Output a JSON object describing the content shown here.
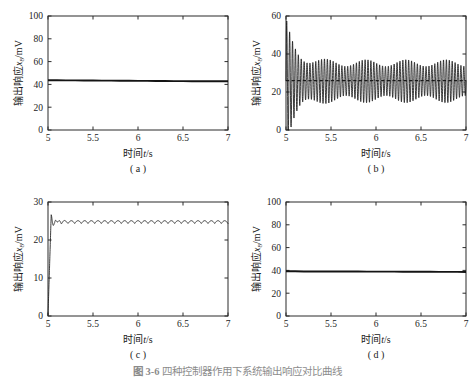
{
  "figure": {
    "caption_number": "图 3-6",
    "caption_text": "四种控制器作用下系统输出响应对比曲线",
    "background_color": "#ffffff",
    "line_color": "#1a1a1a"
  },
  "chart_data": [
    {
      "type": "line",
      "panel_tag": "( a )",
      "title": "",
      "xlabel": "时间t/s",
      "ylabel": "输出响应x8/mV",
      "xlabel_plain": "时间t/s",
      "ylabel_plain": "输出响应x8/mV",
      "xlim": [
        5,
        7
      ],
      "ylim": [
        0,
        100
      ],
      "xticks": [
        5,
        5.5,
        6,
        6.5,
        7
      ],
      "xticklabels": [
        "5",
        "5.5",
        "6",
        "6.5",
        "7"
      ],
      "yticks": [
        0,
        20,
        40,
        60,
        80,
        100
      ],
      "yticklabels": [
        "0",
        "20",
        "40",
        "60",
        "80",
        "100"
      ],
      "grid": false,
      "legend": "none",
      "series": [
        {
          "name": "x8",
          "style": "thick-solid",
          "x": [
            5,
            5.1,
            5.2,
            5.3,
            5.4,
            5.5,
            5.6,
            5.7,
            5.8,
            5.9,
            6,
            6.1,
            6.2,
            6.3,
            6.4,
            6.5,
            6.6,
            6.7,
            6.8,
            6.9,
            7
          ],
          "values": [
            43.6,
            43.6,
            43.5,
            43.5,
            43.4,
            43.4,
            43.3,
            43.3,
            43.2,
            43.2,
            43.1,
            43.1,
            43.0,
            43.0,
            42.9,
            42.9,
            42.8,
            42.8,
            42.8,
            42.7,
            42.7
          ]
        }
      ]
    },
    {
      "type": "line",
      "panel_tag": "( b )",
      "title": "",
      "xlabel": "时间t/s",
      "ylabel": "输出响应x8/mV",
      "xlabel_plain": "时间t/s",
      "ylabel_plain": "输出响应x8/mV",
      "xlim": [
        5,
        7
      ],
      "ylim": [
        0,
        60
      ],
      "xticks": [
        5,
        5.5,
        6,
        6.5,
        7
      ],
      "xticklabels": [
        "5",
        "5.5",
        "6",
        "6.5",
        "7"
      ],
      "yticks": [
        0,
        20,
        40,
        60
      ],
      "yticklabels": [
        "0",
        "20",
        "40",
        "60"
      ],
      "grid": false,
      "legend": "none",
      "oscillation": {
        "description": "damped high-frequency oscillation with beat modulation about a mean of 26 mV",
        "mean": 26,
        "initial_peak": 59,
        "initial_trough": 11,
        "steady_high": 37,
        "steady_low": 20,
        "cycles": 62,
        "decay_rate": 9.0,
        "beat_cycles": 4.5,
        "beat_depth": 0.32
      },
      "reference_line": {
        "name": "setpoint",
        "style": "dashed",
        "value": 26
      }
    },
    {
      "type": "line",
      "panel_tag": "( c )",
      "title": "",
      "xlabel": "时间t/s",
      "ylabel": "输出响应x8/mV",
      "xlabel_plain": "时间t/s",
      "ylabel_plain": "输出响应x8/mV",
      "xlim": [
        5,
        7
      ],
      "ylim": [
        0,
        30
      ],
      "xticks": [
        5,
        5.5,
        6,
        6.5,
        7
      ],
      "xticklabels": [
        "5",
        "5.5",
        "6",
        "6.5",
        "7"
      ],
      "yticks": [
        0,
        10,
        20,
        30
      ],
      "yticklabels": [
        "0",
        "10",
        "20",
        "30"
      ],
      "grid": false,
      "legend": "none",
      "step_response": {
        "description": "fast rise from zero with short damped overshoot, settling at 24.6 mV with small periodic ripple",
        "start_value": 0.2,
        "rise_end_t": 5.035,
        "overshoot_peak": 26.2,
        "undershoot": 18.3,
        "settle_value": 24.6,
        "settle_t": 5.27,
        "ripple_amplitude": 0.75,
        "ripple_cycles": 27,
        "transient_cycles": 5,
        "transient_decay": 22
      }
    },
    {
      "type": "line",
      "panel_tag": "( d )",
      "title": "",
      "xlabel": "时间t/s",
      "ylabel": "输出响应x8/mV",
      "xlabel_plain": "时间t/s",
      "ylabel_plain": "输出响应x8/mV",
      "xlim": [
        5,
        7
      ],
      "ylim": [
        0,
        100
      ],
      "xticks": [
        5,
        5.5,
        6,
        6.5,
        7
      ],
      "xticklabels": [
        "5",
        "5.5",
        "6",
        "6.5",
        "7"
      ],
      "yticks": [
        0,
        20,
        40,
        60,
        80,
        100
      ],
      "yticklabels": [
        "0",
        "20",
        "40",
        "60",
        "80",
        "100"
      ],
      "grid": false,
      "legend": "none",
      "series": [
        {
          "name": "x8",
          "style": "thick-solid",
          "x": [
            5,
            5.1,
            5.2,
            5.3,
            5.4,
            5.5,
            5.6,
            5.7,
            5.8,
            5.9,
            6,
            6.1,
            6.2,
            6.3,
            6.4,
            6.5,
            6.6,
            6.7,
            6.8,
            6.9,
            7
          ],
          "values": [
            39.2,
            39.2,
            39.1,
            39.1,
            39.1,
            39.0,
            39.0,
            39.0,
            39.0,
            38.9,
            38.9,
            38.9,
            38.9,
            38.8,
            38.8,
            38.8,
            38.8,
            38.7,
            38.7,
            38.7,
            38.6
          ]
        }
      ]
    }
  ]
}
